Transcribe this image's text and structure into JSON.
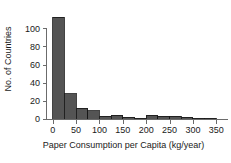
{
  "chart_data": {
    "type": "bar",
    "title": "",
    "subtitle": "",
    "xlabel": "Paper Consumption per Capita (kg/year)",
    "ylabel": "No. of Countries",
    "bin_width": 25,
    "xlim": [
      -10,
      375
    ],
    "ylim": [
      0,
      118
    ],
    "grid": false,
    "legend": null,
    "bar_color": "#545454",
    "bar_edge_color": "#141414",
    "axis_color": "#6b6b6b",
    "text_color": "#1a1a1a",
    "background": "#ffffff",
    "xticks": [
      0,
      50,
      100,
      150,
      200,
      250,
      300,
      350
    ],
    "xtick_labels": [
      "0",
      "50",
      "100",
      "150",
      "200",
      "250",
      "300",
      "350"
    ],
    "yticks": [
      0,
      20,
      40,
      60,
      80,
      100
    ],
    "ytick_labels": [
      "0",
      "20",
      "40",
      "60",
      "80",
      "100"
    ],
    "categories": [
      "0-25",
      "25-50",
      "50-75",
      "75-100",
      "100-125",
      "125-150",
      "150-175",
      "175-200",
      "200-225",
      "225-250",
      "250-275",
      "275-300",
      "300-325",
      "325-350"
    ],
    "bin_edges": [
      0,
      25,
      50,
      75,
      100,
      125,
      150,
      175,
      200,
      225,
      250,
      275,
      300,
      325,
      350
    ],
    "values": [
      112,
      28,
      12,
      9,
      3,
      4,
      2,
      1,
      4,
      3,
      3,
      2,
      1,
      1
    ]
  }
}
